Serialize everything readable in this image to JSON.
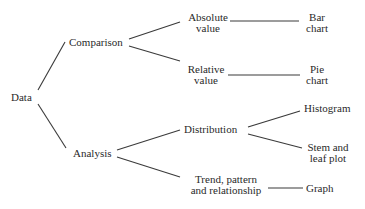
{
  "diagram": {
    "root": "Data",
    "branches": [
      {
        "label": "Comparison",
        "children": [
          {
            "label_lines": [
              "Absolute",
              "value"
            ],
            "leaf_lines": [
              "Bar",
              "chart"
            ]
          },
          {
            "label_lines": [
              "Relative",
              "value"
            ],
            "leaf_lines": [
              "Pie",
              "chart"
            ]
          }
        ]
      },
      {
        "label": "Analysis",
        "children": [
          {
            "label_lines": [
              "Distribution"
            ],
            "leaves": [
              {
                "lines": [
                  "Histogram"
                ]
              },
              {
                "lines": [
                  "Stem and",
                  "leaf plot"
                ]
              }
            ]
          },
          {
            "label_lines": [
              "Trend, pattern",
              "and relationship"
            ],
            "leaf_lines": [
              "Graph"
            ]
          }
        ]
      }
    ]
  }
}
